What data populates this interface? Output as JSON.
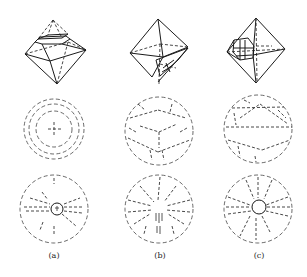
{
  "figure": {
    "panels": [
      {
        "label": "(a)",
        "description": "Octahedron with truncated top facet; concentric dashed circles; radial pattern with small center circle"
      },
      {
        "label": "(b)",
        "description": "Octahedron with etched bottom-right facet; dashed cube projection; radial splay pattern"
      },
      {
        "label": "(c)",
        "description": "Octahedron with etched left vertex facets; dashed great-circle pattern; radial pattern with center circle"
      }
    ]
  }
}
